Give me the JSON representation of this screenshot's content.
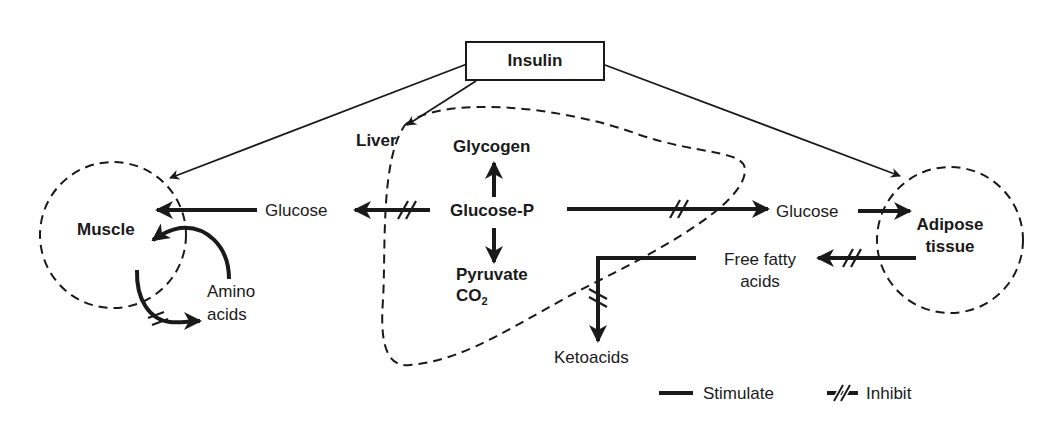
{
  "diagram": {
    "type": "metabolic-regulation",
    "title_node": "Insulin",
    "nodes": {
      "insulin": "Insulin",
      "liver": "Liver",
      "glycogen": "Glycogen",
      "glucose_p": "Glucose-P",
      "pyruvate": "Pyruvate",
      "co2": "CO",
      "co2_sub": "2",
      "glucose_left": "Glucose",
      "glucose_right": "Glucose",
      "muscle": "Muscle",
      "amino": "Amino",
      "acids": "acids",
      "adipose": "Adipose",
      "tissue": "tissue",
      "ffa_line1": "Free fatty",
      "ffa_line2": "acids",
      "ketoacids": "Ketoacids"
    },
    "legend": {
      "stimulate": "Stimulate",
      "inhibit": "Inhibit"
    },
    "edges": [
      {
        "from": "Insulin",
        "to": "Muscle",
        "kind": "stimulate"
      },
      {
        "from": "Insulin",
        "to": "Liver",
        "kind": "stimulate"
      },
      {
        "from": "Insulin",
        "to": "Adipose tissue",
        "kind": "stimulate"
      },
      {
        "from": "Glucose-P",
        "to": "Glycogen",
        "kind": "stimulate"
      },
      {
        "from": "Glucose-P",
        "to": "Pyruvate CO2",
        "kind": "stimulate"
      },
      {
        "from": "Glucose-P",
        "to": "Glucose (left)",
        "kind": "inhibit"
      },
      {
        "from": "Glucose-P",
        "to": "Glucose (right)",
        "kind": "inhibit"
      },
      {
        "from": "Glucose (left)",
        "to": "Muscle",
        "kind": "stimulate"
      },
      {
        "from": "Glucose (right)",
        "to": "Adipose tissue",
        "kind": "stimulate"
      },
      {
        "from": "Adipose tissue",
        "to": "Free fatty acids",
        "kind": "inhibit"
      },
      {
        "from": "Free fatty acids",
        "to": "Ketoacids",
        "kind": "inhibit"
      },
      {
        "from": "Amino acids",
        "to": "Muscle",
        "kind": "stimulate"
      },
      {
        "from": "Muscle",
        "to": "Amino acids",
        "kind": "inhibit"
      }
    ]
  }
}
